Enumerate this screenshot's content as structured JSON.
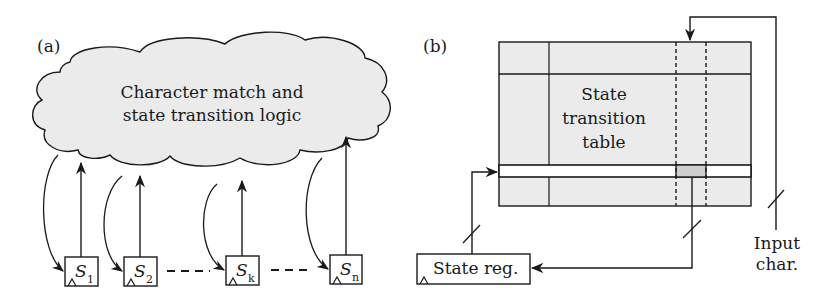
{
  "panel_a": {
    "label": "(a)",
    "cloud": {
      "line1": "Character match and",
      "line2": "state transition logic"
    },
    "registers": [
      {
        "symbol": "S",
        "subscript": "1"
      },
      {
        "symbol": "S",
        "subscript": "2"
      },
      {
        "symbol": "S",
        "subscript": "k"
      },
      {
        "symbol": "S",
        "subscript": "n"
      }
    ]
  },
  "panel_b": {
    "label": "(b)",
    "table": {
      "line1": "State",
      "line2": "transition",
      "line3": "table"
    },
    "state_reg": "State reg.",
    "input": {
      "line1": "Input",
      "line2": "char."
    }
  },
  "colors": {
    "fill": "#ebebeb",
    "highlight": "#cfcfcf",
    "stroke": "#1a1a1a"
  }
}
